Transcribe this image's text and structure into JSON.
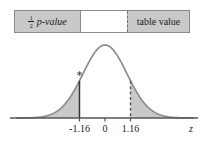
{
  "figure": {
    "title": "",
    "table_strip": {
      "left_cell": {
        "numerator": "1",
        "denominator": "2",
        "text": "p-value",
        "full_label": "1/2 p-value",
        "background": "#c9c9c9"
      },
      "middle_cell": {
        "label": "",
        "background": "#ffffff"
      },
      "right_cell": {
        "label": "table value",
        "background": "#c9c9c9"
      }
    }
  },
  "chart_data": {
    "type": "area",
    "title": "",
    "xlabel": "z",
    "ylabel": "",
    "xlim": [
      -4.0,
      4.0
    ],
    "ylim": [
      0,
      0.42
    ],
    "grid": false,
    "legend": null,
    "distribution": "standard normal",
    "x_ticks": [
      -1.16,
      0,
      1.16
    ],
    "x_tick_labels": [
      "-1.16",
      "0",
      "1.16"
    ],
    "axis_label": "z",
    "curve": {
      "name": "standard normal density",
      "mean": 0,
      "sd": 1,
      "stroke": "#8e8e8e",
      "fill": "#ffffff"
    },
    "shaded_regions": [
      {
        "name": "left-tail",
        "from": -4.0,
        "to": -1.16,
        "fill": "#c9c9c9",
        "label": "1/2 p-value"
      },
      {
        "name": "right-tail",
        "from": 1.16,
        "to": 4.0,
        "fill": "#c9c9c9",
        "label": "table value"
      }
    ],
    "markers": [
      {
        "name": "critical-line-left",
        "x": -1.16,
        "style": "solid",
        "color": "#333333",
        "annotation": "*"
      },
      {
        "name": "critical-line-right",
        "x": 1.16,
        "style": "dashed",
        "color": "#555555",
        "annotation": ""
      }
    ],
    "annotations": [
      {
        "name": "asterisk",
        "text": "*",
        "x": -1.16
      }
    ]
  }
}
